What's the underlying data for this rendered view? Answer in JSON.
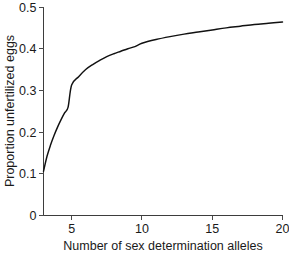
{
  "chart_data": {
    "type": "line",
    "title": "",
    "xlabel": "Number of sex determination alleles",
    "ylabel": "Proportion unfertilized eggs",
    "xlim": [
      3,
      20
    ],
    "ylim": [
      0,
      0.5
    ],
    "grid": false,
    "legend": "none",
    "curve_color": "#111111",
    "axis_color": "#3d3d3d",
    "x_ticks": [
      {
        "value": 5,
        "label": "5"
      },
      {
        "value": 10,
        "label": "10"
      },
      {
        "value": 15,
        "label": "15"
      },
      {
        "value": 20,
        "label": "20"
      }
    ],
    "y_ticks": [
      {
        "value": 0,
        "label": "0"
      },
      {
        "value": 0.1,
        "label": "0.1"
      },
      {
        "value": 0.2,
        "label": "0.2"
      },
      {
        "value": 0.3,
        "label": "0.3"
      },
      {
        "value": 0.4,
        "label": "0.4"
      },
      {
        "value": 0.5,
        "label": "0.5"
      }
    ],
    "series": [
      {
        "name": "Proportion unfertilized eggs",
        "x": [
          3,
          3.25,
          3.5,
          3.75,
          4,
          4.25,
          4.5,
          4.75,
          5,
          5.5,
          6,
          6.5,
          7,
          7.5,
          8,
          8.5,
          9,
          9.5,
          10,
          11,
          12,
          13,
          14,
          15,
          16,
          17,
          18,
          19,
          20
        ],
        "values": [
          0.106,
          0.142,
          0.169,
          0.192,
          0.212,
          0.23,
          0.246,
          0.26,
          0.313,
          0.333,
          0.35,
          0.362,
          0.372,
          0.381,
          0.388,
          0.394,
          0.4,
          0.405,
          0.413,
          0.422,
          0.429,
          0.435,
          0.44,
          0.445,
          0.45,
          0.454,
          0.458,
          0.461,
          0.464
        ]
      }
    ]
  }
}
